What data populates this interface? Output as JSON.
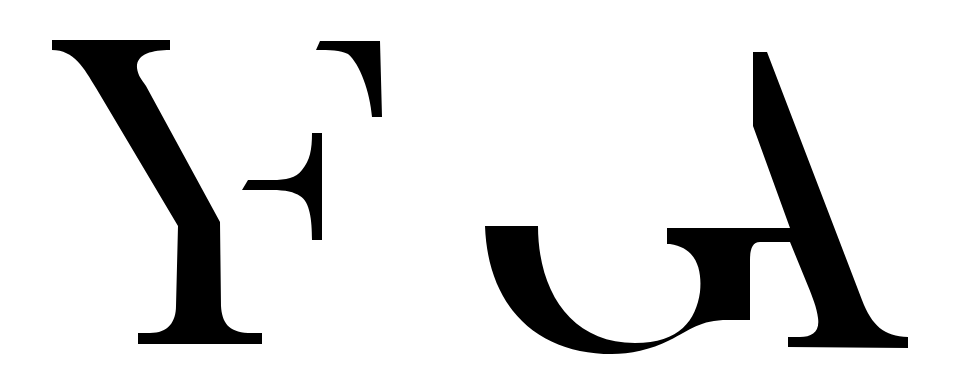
{
  "logo": {
    "label": "YF GA",
    "glyphs": [
      {
        "id": "Y",
        "description": "serif letter Y"
      },
      {
        "id": "F",
        "description": "fragmented serif letter F"
      },
      {
        "id": "G",
        "description": "fragmented lower curve of letter G"
      },
      {
        "id": "A",
        "description": "fragmented serif letter A"
      }
    ],
    "colors": {
      "ink": "#000000",
      "background": "#ffffff"
    }
  }
}
